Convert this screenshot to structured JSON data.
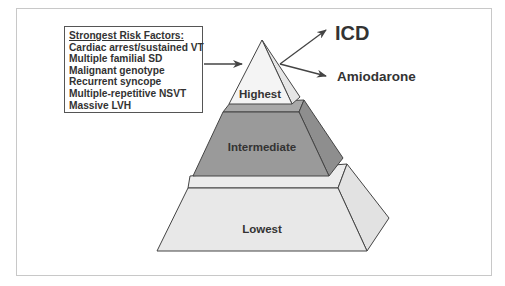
{
  "risk_box": {
    "heading": "Strongest Risk Factors:",
    "items": [
      "Cardiac arrest/sustained VT",
      "Multiple familial SD",
      "Malignant genotype",
      "Recurrent syncope",
      "Multiple-repetitive NSVT",
      "Massive LVH"
    ]
  },
  "pyramid": {
    "tiers": [
      {
        "label": "Highest",
        "fill": "#f2f2f2"
      },
      {
        "label": "Intermediate",
        "fill": "#9a9a9a"
      },
      {
        "label": "Lowest",
        "fill": "#e8e8e8"
      }
    ]
  },
  "treatments": {
    "primary": "ICD",
    "secondary": "Amiodarone"
  },
  "colors": {
    "stroke": "#444444",
    "text": "#333333",
    "frame": "#c8c8c8"
  }
}
